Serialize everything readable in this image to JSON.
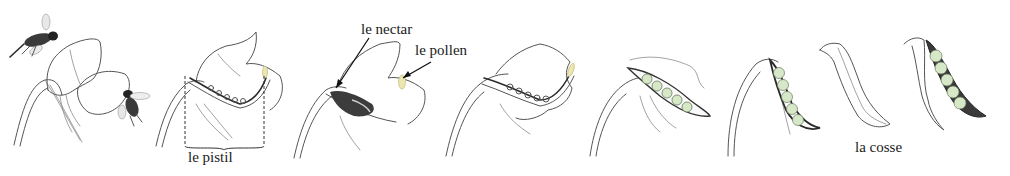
{
  "figure": {
    "stages": [
      {
        "id": 1,
        "description": "flower with bees"
      },
      {
        "id": 2,
        "description": "flower cross-section showing pistil"
      },
      {
        "id": 3,
        "description": "bee inside flower reaching nectar, pollen at stamen"
      },
      {
        "id": 4,
        "description": "fertilized pistil with ovules"
      },
      {
        "id": 5,
        "description": "young pod with developing peas, withered petals"
      },
      {
        "id": 6,
        "description": "growing pod with peas"
      },
      {
        "id": 7,
        "description": "closed mature pod"
      },
      {
        "id": 8,
        "description": "opened pod showing peas"
      }
    ]
  },
  "labels": {
    "pistil": "le pistil",
    "nectar": "le nectar",
    "pollen": "le pollen",
    "pod": "la cosse"
  },
  "colors": {
    "background": "#ffffff",
    "ink": "#555555",
    "pollen": "#ece7b0",
    "pea": "#d6e8c8",
    "pea_outline": "#6a7a5e",
    "text": "#1a1a1a"
  }
}
